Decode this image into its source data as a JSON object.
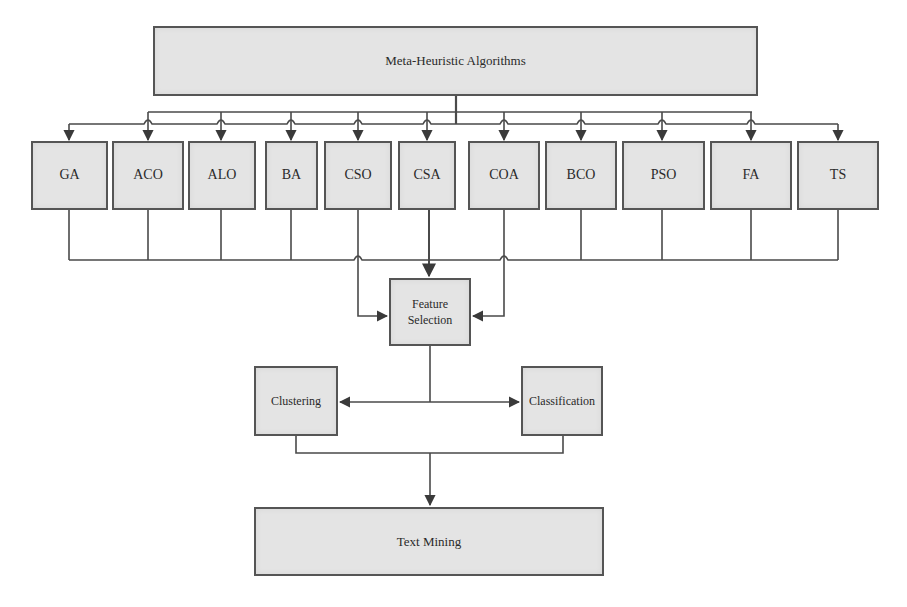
{
  "diagram": {
    "root": {
      "label": "Meta-Heuristic Algorithms"
    },
    "algorithms": [
      {
        "id": "ga",
        "label": "GA"
      },
      {
        "id": "aco",
        "label": "ACO"
      },
      {
        "id": "alo",
        "label": "ALO"
      },
      {
        "id": "ba",
        "label": "BA"
      },
      {
        "id": "cso",
        "label": "CSO"
      },
      {
        "id": "csa",
        "label": "CSA"
      },
      {
        "id": "coa",
        "label": "COA"
      },
      {
        "id": "bco",
        "label": "BCO"
      },
      {
        "id": "pso",
        "label": "PSO"
      },
      {
        "id": "fa",
        "label": "FA"
      },
      {
        "id": "ts",
        "label": "TS"
      }
    ],
    "feature_selection": {
      "line1": "Feature",
      "line2": "Selection"
    },
    "clustering": {
      "label": "Clustering"
    },
    "classification": {
      "label": "Classification"
    },
    "output": {
      "label": "Text Mining"
    },
    "colors": {
      "box_fill": "#e4e4e4",
      "box_border": "#555555",
      "line": "#4a4a4a",
      "text": "#2a2a2a"
    }
  }
}
